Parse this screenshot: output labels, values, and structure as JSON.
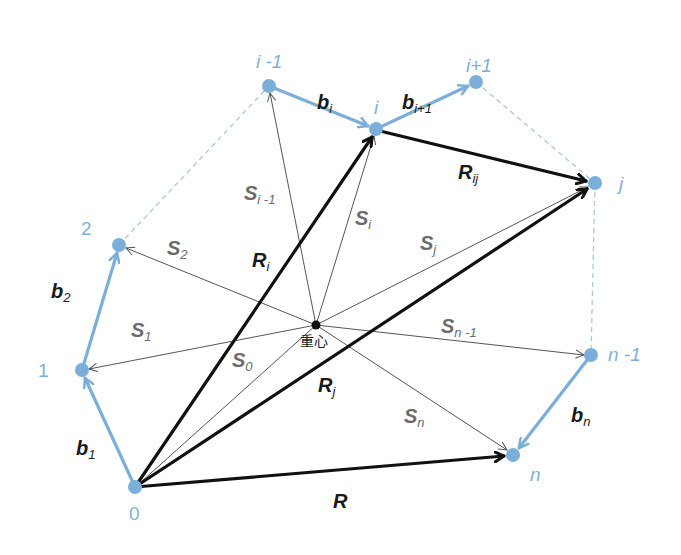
{
  "diagram": {
    "colors": {
      "bond": "#7bafd9",
      "chain_vector": "#111111",
      "gyration_vector": "#555555",
      "dashed": "#a9c8e0",
      "point_label": "#7fb0d8"
    },
    "centroid": {
      "x": 316,
      "y": 325,
      "label": "重心"
    },
    "points": [
      {
        "id": "0",
        "label": "0",
        "x": 135,
        "y": 487
      },
      {
        "id": "1",
        "label": "1",
        "x": 82,
        "y": 370
      },
      {
        "id": "2",
        "label": "2",
        "x": 119,
        "y": 245
      },
      {
        "id": "i-1",
        "label": "i -1",
        "x": 269,
        "y": 86
      },
      {
        "id": "i",
        "label": "i",
        "x": 376,
        "y": 129
      },
      {
        "id": "i+1",
        "label": "i+1",
        "x": 476,
        "y": 82
      },
      {
        "id": "j",
        "label": "j",
        "x": 595,
        "y": 183
      },
      {
        "id": "n-1",
        "label": "n -1",
        "x": 591,
        "y": 355
      },
      {
        "id": "n",
        "label": "n",
        "x": 513,
        "y": 455
      }
    ],
    "bonds": [
      {
        "name": "b1",
        "base": "b",
        "sub": "1",
        "from": "0",
        "to": "1"
      },
      {
        "name": "b2",
        "base": "b",
        "sub": "2",
        "from": "1",
        "to": "2"
      },
      {
        "name": "bi",
        "base": "b",
        "sub": "i",
        "from": "i-1",
        "to": "i"
      },
      {
        "name": "bi+1",
        "base": "b",
        "sub": "i+1",
        "from": "i",
        "to": "i+1"
      },
      {
        "name": "bn",
        "base": "b",
        "sub": "n",
        "from": "n-1",
        "to": "n"
      }
    ],
    "dashed_links": [
      [
        "2",
        "i-1"
      ],
      [
        "i+1",
        "j"
      ],
      [
        "j",
        "n-1"
      ]
    ],
    "chain_vectors": [
      {
        "name": "R",
        "base": "R",
        "sub": "",
        "from": "0",
        "to": "n"
      },
      {
        "name": "Ri",
        "base": "R",
        "sub": "i",
        "from": "0",
        "to": "i"
      },
      {
        "name": "Rj",
        "base": "R",
        "sub": "j",
        "from": "0",
        "to": "j"
      },
      {
        "name": "Rij",
        "base": "R",
        "sub": "ij",
        "from": "i",
        "to": "j"
      }
    ],
    "gyration_vectors": [
      {
        "name": "S0",
        "base": "S",
        "sub": "0",
        "to": "0"
      },
      {
        "name": "S1",
        "base": "S",
        "sub": "1",
        "to": "1"
      },
      {
        "name": "S2",
        "base": "S",
        "sub": "2",
        "to": "2"
      },
      {
        "name": "Si-1",
        "base": "S",
        "sub": "i -1",
        "to": "i-1"
      },
      {
        "name": "Si",
        "base": "S",
        "sub": "i",
        "to": "i"
      },
      {
        "name": "Sj",
        "base": "S",
        "sub": "j",
        "to": "j"
      },
      {
        "name": "Sn-1",
        "base": "S",
        "sub": "n -1",
        "to": "n-1"
      },
      {
        "name": "Sn",
        "base": "S",
        "sub": "n",
        "to": "n"
      }
    ]
  },
  "labels": {
    "p0": "0",
    "p1": "1",
    "p2": "2",
    "pim1": "i -1",
    "pi": "i",
    "pip1": "i+1",
    "pj": "j",
    "pnm1": "n -1",
    "pn": "n",
    "b1": {
      "base": "b",
      "sub": "1"
    },
    "b2": {
      "base": "b",
      "sub": "2"
    },
    "bi": {
      "base": "b",
      "sub": "i"
    },
    "bip1": {
      "base": "b",
      "sub": "i+1"
    },
    "bn": {
      "base": "b",
      "sub": "n"
    },
    "R": {
      "base": "R"
    },
    "Ri": {
      "base": "R",
      "sub": "i"
    },
    "Rj": {
      "base": "R",
      "sub": "j"
    },
    "Rij": {
      "base": "R",
      "sub": "ij"
    },
    "S0": {
      "base": "S",
      "sub": "0"
    },
    "S1": {
      "base": "S",
      "sub": "1"
    },
    "S2": {
      "base": "S",
      "sub": "2"
    },
    "Sim1": {
      "base": "S",
      "sub": "i -1"
    },
    "Si": {
      "base": "S",
      "sub": "i"
    },
    "Sj": {
      "base": "S",
      "sub": "j"
    },
    "Snm1": {
      "base": "S",
      "sub": "n -1"
    },
    "Sn": {
      "base": "S",
      "sub": "n"
    },
    "centroid": "重心"
  }
}
